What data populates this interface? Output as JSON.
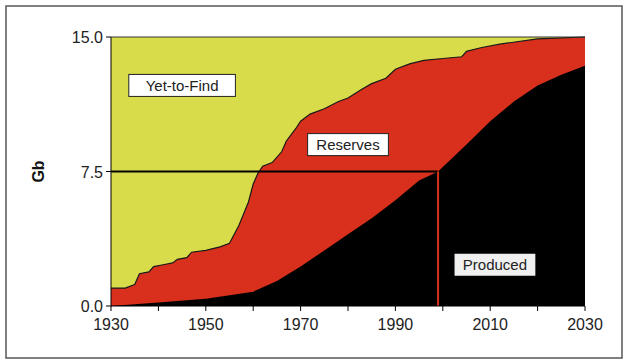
{
  "chart_data": {
    "type": "area",
    "title": "",
    "xlabel": "",
    "ylabel": "Gb",
    "xlim": [
      1930,
      2030
    ],
    "ylim": [
      0.0,
      15.0
    ],
    "x_ticks": [
      "1930",
      "1950",
      "1970",
      "1990",
      "2010",
      "2030"
    ],
    "y_ticks": [
      "0.0",
      "7.5",
      "15.0"
    ],
    "stacked_regions": [
      {
        "name": "Produced",
        "color": "#000000"
      },
      {
        "name": "Reserves",
        "color": "#d8301c"
      },
      {
        "name": "Yet-to-Find",
        "color": "#d8dc4a"
      }
    ],
    "series": [
      {
        "name": "Cumulative Discovery",
        "x": [
          1930,
          1933,
          1935,
          1936,
          1938,
          1939,
          1941,
          1943,
          1944,
          1946,
          1947,
          1950,
          1953,
          1955,
          1957,
          1959,
          1960,
          1961,
          1962,
          1964,
          1966,
          1967,
          1969,
          1970,
          1972,
          1975,
          1978,
          1980,
          1983,
          1985,
          1988,
          1990,
          1993,
          1996,
          2000,
          2004,
          2005,
          2008,
          2012,
          2020,
          2030
        ],
        "values": [
          1.0,
          1.0,
          1.2,
          1.8,
          1.9,
          2.2,
          2.3,
          2.4,
          2.6,
          2.7,
          3.0,
          3.1,
          3.3,
          3.5,
          4.5,
          5.8,
          6.8,
          7.4,
          7.8,
          8.0,
          8.6,
          9.2,
          9.9,
          10.3,
          10.7,
          11.0,
          11.4,
          11.6,
          12.1,
          12.4,
          12.7,
          13.2,
          13.5,
          13.7,
          13.8,
          13.9,
          14.2,
          14.4,
          14.6,
          14.9,
          15.0
        ]
      },
      {
        "name": "Cumulative Production",
        "x": [
          1930,
          1940,
          1950,
          1955,
          1960,
          1965,
          1970,
          1975,
          1980,
          1985,
          1990,
          1995,
          1999,
          2005,
          2010,
          2015,
          2020,
          2025,
          2030
        ],
        "values": [
          0.0,
          0.2,
          0.4,
          0.6,
          0.8,
          1.4,
          2.2,
          3.1,
          4.0,
          4.9,
          5.9,
          7.0,
          7.5,
          9.0,
          10.3,
          11.4,
          12.3,
          12.9,
          13.4
        ]
      }
    ],
    "annotations": [
      {
        "text": "Yet-to-Find",
        "x": 1945,
        "y": 12.3
      },
      {
        "text": "Reserves",
        "x": 1980,
        "y": 9.0
      },
      {
        "text": "Produced",
        "x": 2011,
        "y": 2.3
      },
      {
        "type": "hline",
        "y": 7.5,
        "x_from": 1930,
        "x_to": 1999,
        "color": "#000000"
      },
      {
        "type": "vline",
        "x": 1999,
        "y_from": 0.0,
        "y_to": 7.5,
        "color": "#d8301c"
      }
    ],
    "grid": false,
    "legend": "none"
  },
  "labels": {
    "yet_to_find": "Yet-to-Find",
    "reserves": "Reserves",
    "produced": "Produced",
    "ylabel": "Gb"
  }
}
